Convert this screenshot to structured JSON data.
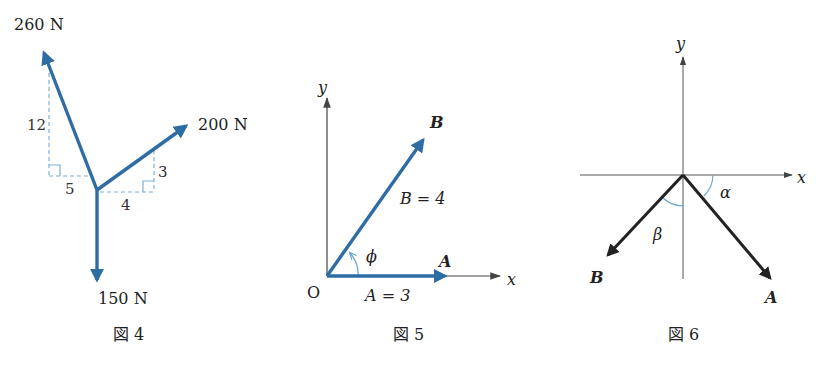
{
  "figures": [
    {
      "caption": "図 4",
      "forces": [
        {
          "label": "260 N",
          "direction_ratio": {
            "horizontal": -5,
            "vertical": 12
          }
        },
        {
          "label": "200 N",
          "direction_ratio": {
            "horizontal": 4,
            "vertical": 3
          }
        },
        {
          "label": "150 N",
          "direction": "down"
        }
      ],
      "triangle_labels": {
        "left_vertical": "12",
        "left_horizontal": "5",
        "right_vertical": "3",
        "right_horizontal": "4"
      }
    },
    {
      "caption": "図 5",
      "axes": {
        "x": "x",
        "y": "y",
        "origin": "O"
      },
      "vectors": [
        {
          "name": "A",
          "magnitude_label": "A = 3"
        },
        {
          "name": "B",
          "magnitude_label": "B = 4"
        }
      ],
      "angle_label": "ϕ"
    },
    {
      "caption": "図 6",
      "axes": {
        "x": "x",
        "y": "y"
      },
      "vectors": [
        {
          "name": "A"
        },
        {
          "name": "B"
        }
      ],
      "angle_labels": {
        "alpha": "α",
        "beta": "β"
      }
    }
  ],
  "colors": {
    "vector_blue": "#2e6da4",
    "dashed_blue": "#7fb0d8",
    "arc_blue": "#6aa8d8",
    "axis_gray": "#555555",
    "vector_black": "#222222"
  }
}
